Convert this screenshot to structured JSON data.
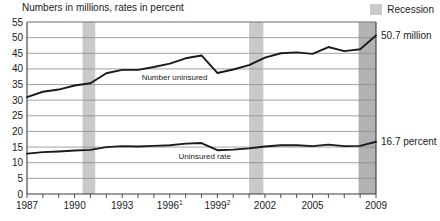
{
  "chart_title": "Numbers in millions, rates in percent",
  "legend": {
    "recession_label": "Recession",
    "recession_color": "#c9c9c9"
  },
  "axes": {
    "y_ticks": [
      "0",
      "5",
      "10",
      "15",
      "20",
      "25",
      "30",
      "35",
      "40",
      "45",
      "50",
      "55"
    ],
    "y_min": 0,
    "y_max": 55,
    "y_step": 5,
    "x_ticks": [
      "1987",
      "1990",
      "1993",
      "1996",
      "1999",
      "2002",
      "2005",
      "2009"
    ],
    "x_tick_superscripts": [
      "",
      "",
      "",
      "1",
      "2",
      "",
      "",
      ""
    ],
    "x_min": 1987,
    "x_max": 2009
  },
  "series_labels": {
    "number_uninsured": "Number uninsured",
    "uninsured_rate": "Uninsured rate"
  },
  "end_labels": {
    "number_uninsured": "50.7 million",
    "uninsured_rate": "16.7 percent"
  },
  "chart_data": {
    "type": "line",
    "title": "Numbers in millions, rates in percent",
    "xlabel": "",
    "ylabel": "",
    "ylim": [
      0,
      55
    ],
    "xlim": [
      1987,
      2009
    ],
    "grid": true,
    "legend_position": "top-right",
    "x": [
      1987,
      1988,
      1989,
      1990,
      1991,
      1992,
      1993,
      1994,
      1995,
      1996,
      1997,
      1998,
      1999,
      2000,
      2001,
      2002,
      2003,
      2004,
      2005,
      2006,
      2007,
      2008,
      2009
    ],
    "series": [
      {
        "name": "Number uninsured",
        "unit": "millions",
        "values": [
          31.0,
          32.7,
          33.4,
          34.7,
          35.4,
          38.6,
          39.7,
          39.7,
          40.6,
          41.7,
          43.4,
          44.3,
          38.7,
          39.8,
          41.2,
          43.6,
          45.0,
          45.3,
          44.8,
          47.0,
          45.7,
          46.3,
          50.7
        ]
      },
      {
        "name": "Uninsured rate",
        "unit": "percent",
        "values": [
          12.9,
          13.4,
          13.6,
          13.9,
          14.1,
          15.0,
          15.3,
          15.2,
          15.4,
          15.6,
          16.1,
          16.3,
          14.0,
          14.2,
          14.6,
          15.2,
          15.6,
          15.6,
          15.3,
          15.8,
          15.3,
          15.4,
          16.7
        ]
      }
    ],
    "recession_bands": [
      {
        "start": 1990.5,
        "end": 1991.3,
        "shade": "light"
      },
      {
        "start": 2001.0,
        "end": 2001.9,
        "shade": "light"
      },
      {
        "start": 2007.9,
        "end": 2009.4,
        "shade": "dark"
      }
    ],
    "annotations": [
      {
        "text": "50.7 million",
        "series": "Number uninsured",
        "at_x": 2009
      },
      {
        "text": "16.7 percent",
        "series": "Uninsured rate",
        "at_x": 2009
      }
    ]
  }
}
